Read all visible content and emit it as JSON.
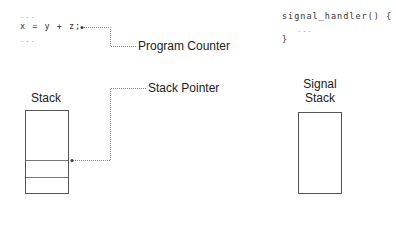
{
  "code": {
    "main_lines": [
      "...",
      "x = y + z;",
      "..."
    ],
    "handler_lines": [
      "signal_handler() {",
      "...",
      "}"
    ]
  },
  "labels": {
    "program_counter": "Program Counter",
    "stack_pointer": "Stack Pointer",
    "stack": "Stack",
    "signal_stack_line1": "Signal",
    "signal_stack_line2": "Stack"
  },
  "colors": {
    "line": "#555555",
    "dotted": "#888888",
    "text": "#222222"
  }
}
